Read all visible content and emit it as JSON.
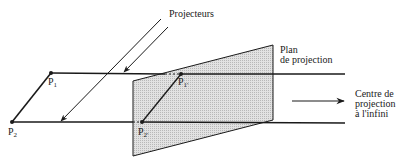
{
  "diagram": {
    "title": "",
    "labels": {
      "projectors": "Projecteurs",
      "plane_line1": "Plan",
      "plane_line2": "de projection",
      "center_line1": "Centre de",
      "center_line2": "projection",
      "center_line3": "à l'infini"
    },
    "points": [
      {
        "name": "P",
        "sub": "1",
        "x": 51,
        "y": 73
      },
      {
        "name": "P",
        "sub": "2",
        "x": 12,
        "y": 122
      },
      {
        "name": "P",
        "sub": "1'",
        "x": 181,
        "y": 74
      },
      {
        "name": "P",
        "sub": "2'",
        "x": 142,
        "y": 122
      }
    ],
    "colors": {
      "line": "#1a1a1a",
      "plane_fill": "#d4d4d4",
      "background": "#ffffff"
    }
  }
}
